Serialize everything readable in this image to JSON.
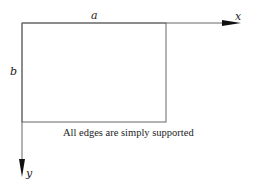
{
  "diagram": {
    "labels": {
      "side_top": "a",
      "side_left": "b",
      "x_axis": "x",
      "y_axis": "y"
    },
    "caption": "All edges are simply supported",
    "colors": {
      "line": "#555555",
      "arrow": "#111111",
      "text": "#222222",
      "background": "#ffffff"
    },
    "geometry": {
      "origin": [
        22,
        23
      ],
      "rect_width_px": 144,
      "rect_height_px": 99,
      "x_arrow_tip": [
        241,
        23
      ],
      "y_arrow_tip": [
        22,
        176
      ]
    }
  }
}
